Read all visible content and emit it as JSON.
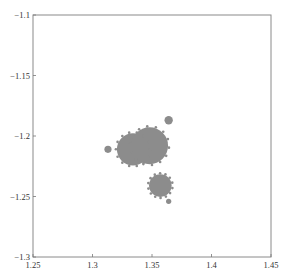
{
  "chart_data": {
    "type": "scatter",
    "title": "",
    "xlabel": "",
    "ylabel": "",
    "xlim": [
      1.25,
      1.45
    ],
    "ylim": [
      -1.3,
      -1.1
    ],
    "grid": false,
    "legend": null,
    "x_ticks": [
      "1.25",
      "1.3",
      "1.35",
      "1.4",
      "1.45"
    ],
    "y_ticks": [
      "-1.1",
      "-1.15",
      "-1.2",
      "-1.25",
      "-1.3"
    ],
    "fill_color": "#8c8c8c",
    "shapes": [
      {
        "name": "main-bulb-left",
        "cx": 1.334,
        "cy": -1.211,
        "r": 0.0135
      },
      {
        "name": "main-bulb-right",
        "cx": 1.348,
        "cy": -1.208,
        "r": 0.0155
      },
      {
        "name": "lower-bulb",
        "cx": 1.357,
        "cy": -1.241,
        "r": 0.0095
      },
      {
        "name": "left-satellite",
        "cx": 1.313,
        "cy": -1.211,
        "r": 0.003
      },
      {
        "name": "upper-right-satellite",
        "cx": 1.364,
        "cy": -1.187,
        "r": 0.0035
      },
      {
        "name": "bottom-satellite",
        "cx": 1.364,
        "cy": -1.254,
        "r": 0.0022
      }
    ]
  },
  "axes": {
    "x_ticks": [
      {
        "value": 1.25,
        "label": "1.25"
      },
      {
        "value": 1.3,
        "label": "1.3"
      },
      {
        "value": 1.35,
        "label": "1.35"
      },
      {
        "value": 1.4,
        "label": "1.4"
      },
      {
        "value": 1.45,
        "label": "1.45"
      }
    ],
    "y_ticks": [
      {
        "value": -1.1,
        "label": "-1.1"
      },
      {
        "value": -1.15,
        "label": "-1.15"
      },
      {
        "value": -1.2,
        "label": "-1.2"
      },
      {
        "value": -1.25,
        "label": "-1.25"
      },
      {
        "value": -1.3,
        "label": "-1.3"
      }
    ]
  },
  "colors": {
    "fractal": "#8c8c8c",
    "axis": "#777777",
    "background": "#ffffff"
  }
}
